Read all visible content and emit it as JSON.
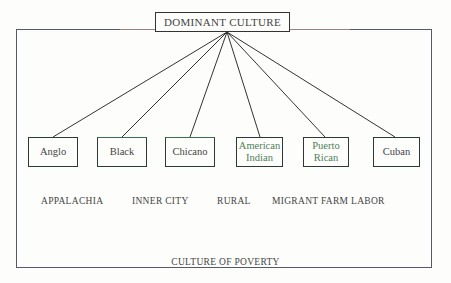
{
  "diagram": {
    "title": "DOMINANT CULTURE",
    "cultures": [
      {
        "label": "Anglo",
        "color": "#444444"
      },
      {
        "label": "Black",
        "color": "#444444"
      },
      {
        "label": "Chicano",
        "color": "#444444"
      },
      {
        "label": "American Indian",
        "color": "#4f7f58"
      },
      {
        "label": "Puerto Rican",
        "color": "#4f7f58"
      },
      {
        "label": "Cuban",
        "color": "#444444"
      }
    ],
    "regions": [
      "APPALACHIA",
      "INNER CITY",
      "RURAL",
      "MIGRANT FARM LABOR"
    ],
    "footer": "CULTURE OF POVERTY"
  }
}
